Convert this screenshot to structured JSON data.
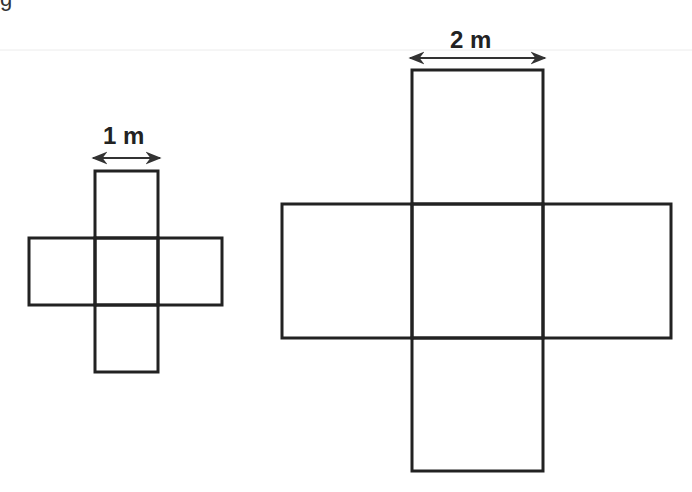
{
  "partial_text": "g",
  "colors": {
    "stroke": "#222222",
    "background": "#ffffff",
    "rule": "#e8e8e8"
  },
  "figures": [
    {
      "name": "small-cube-net",
      "dimension_label": "1 m",
      "squares": [
        {
          "x": 95,
          "y": 171,
          "w": 63,
          "h": 67
        },
        {
          "x": 29,
          "y": 238,
          "w": 66,
          "h": 67
        },
        {
          "x": 95,
          "y": 238,
          "w": 63,
          "h": 67
        },
        {
          "x": 158,
          "y": 238,
          "w": 64,
          "h": 67
        },
        {
          "x": 95,
          "y": 305,
          "w": 63,
          "h": 67
        }
      ]
    },
    {
      "name": "large-cube-net",
      "dimension_label": "2 m",
      "squares": [
        {
          "x": 412,
          "y": 70,
          "w": 131,
          "h": 134
        },
        {
          "x": 282,
          "y": 204,
          "w": 130,
          "h": 134
        },
        {
          "x": 412,
          "y": 204,
          "w": 131,
          "h": 134
        },
        {
          "x": 543,
          "y": 204,
          "w": 128,
          "h": 134
        },
        {
          "x": 412,
          "y": 338,
          "w": 131,
          "h": 133
        }
      ]
    }
  ]
}
